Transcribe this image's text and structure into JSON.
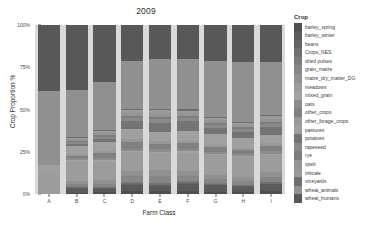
{
  "chart_data": {
    "type": "bar",
    "stacked": true,
    "stack_normalized": true,
    "title": "2009",
    "xlabel": "Farm Class",
    "ylabel": "Crop Proportion %",
    "legend_title": "Crop",
    "legend_position": "right",
    "grid": false,
    "ylim": [
      0,
      100
    ],
    "ytick_labels": [
      "0%",
      "25%",
      "50%",
      "75%",
      "100%"
    ],
    "ytick_values": [
      0,
      25,
      50,
      75,
      100
    ],
    "categories": [
      "A",
      "B",
      "C",
      "D",
      "E",
      "F",
      "G",
      "H",
      "I"
    ],
    "series": [
      {
        "name": "barley_spring",
        "color": "#4f4f4f",
        "values": [
          0.0,
          0.8,
          1.2,
          1.5,
          1.8,
          1.6,
          1.4,
          1.3,
          1.5
        ]
      },
      {
        "name": "barley_winter",
        "color": "#5a5a5a",
        "values": [
          0.0,
          2.6,
          2.0,
          4.0,
          3.2,
          4.5,
          3.8,
          3.0,
          4.2
        ]
      },
      {
        "name": "beans",
        "color": "#656565",
        "values": [
          0.0,
          0.4,
          0.3,
          0.5,
          0.5,
          0.5,
          0.4,
          0.4,
          0.5
        ]
      },
      {
        "name": "Crops_NES",
        "color": "#707070",
        "values": [
          0.0,
          0.5,
          0.6,
          0.8,
          0.9,
          0.7,
          0.6,
          0.6,
          0.7
        ]
      },
      {
        "name": "dried pulses",
        "color": "#7b7b7b",
        "values": [
          0.0,
          0.3,
          0.3,
          0.4,
          0.4,
          0.4,
          0.3,
          0.3,
          0.4
        ]
      },
      {
        "name": "grain_maize",
        "color": "#868686",
        "values": [
          0.0,
          1.2,
          1.6,
          3.5,
          4.0,
          3.2,
          2.4,
          2.0,
          3.0
        ]
      },
      {
        "name": "maize_dry_matter_DG",
        "color": "#919191",
        "values": [
          0.0,
          1.8,
          2.2,
          3.0,
          3.4,
          3.0,
          2.6,
          2.4,
          2.8
        ]
      },
      {
        "name": "meadows",
        "color": "#9c9c9c",
        "values": [
          11.0,
          12.0,
          11.0,
          11.0,
          10.0,
          10.5,
          11.5,
          12.0,
          10.0
        ]
      },
      {
        "name": "mixed_grain",
        "color": "#a3a3a3",
        "values": [
          0.0,
          0.6,
          0.7,
          0.8,
          0.9,
          0.8,
          0.7,
          0.7,
          0.8
        ]
      },
      {
        "name": "oats",
        "color": "#8c8c8c",
        "values": [
          0.0,
          1.0,
          1.2,
          1.4,
          1.6,
          1.3,
          1.1,
          1.0,
          1.3
        ]
      },
      {
        "name": "other_crops",
        "color": "#808080",
        "values": [
          0.0,
          1.4,
          3.2,
          4.0,
          3.0,
          3.6,
          2.8,
          2.6,
          3.4
        ]
      },
      {
        "name": "other_forage_crops",
        "color": "#989898",
        "values": [
          0.0,
          1.0,
          1.2,
          1.6,
          1.8,
          1.5,
          1.3,
          1.2,
          1.5
        ]
      },
      {
        "name": "pastures",
        "color": "#a0a0a0",
        "values": [
          6.0,
          5.0,
          5.5,
          6.0,
          5.0,
          5.5,
          6.5,
          6.0,
          5.0
        ]
      },
      {
        "name": "potatoes",
        "color": "#747474",
        "values": [
          0.0,
          1.0,
          1.4,
          4.5,
          5.5,
          6.0,
          4.0,
          3.5,
          4.5
        ]
      },
      {
        "name": "rapeseed",
        "color": "#8a8a8a",
        "values": [
          0.0,
          1.2,
          1.6,
          2.0,
          2.4,
          2.0,
          1.8,
          1.6,
          2.0
        ]
      },
      {
        "name": "rye",
        "color": "#7d7d7d",
        "values": [
          0.0,
          0.8,
          1.0,
          1.2,
          1.4,
          1.2,
          1.0,
          0.9,
          1.2
        ]
      },
      {
        "name": "spelt",
        "color": "#949494",
        "values": [
          0.0,
          1.0,
          1.2,
          2.0,
          2.2,
          1.8,
          1.6,
          1.4,
          1.8
        ]
      },
      {
        "name": "triticale",
        "color": "#9a9a9a",
        "values": [
          0.0,
          0.9,
          1.1,
          1.4,
          1.6,
          1.3,
          1.2,
          1.1,
          1.4
        ]
      },
      {
        "name": "vineyards",
        "color": "#6e6e6e",
        "values": [
          0.0,
          0.5,
          0.6,
          0.8,
          0.9,
          0.7,
          0.6,
          0.6,
          0.8
        ]
      },
      {
        "name": "wheat_animals",
        "color": "#909090",
        "values": [
          44.0,
          27.5,
          28.4,
          28.6,
          29.5,
          29.9,
          33.3,
          35.4,
          31.2
        ]
      },
      {
        "name": "wheat_humans",
        "color": "#585858",
        "values": [
          39.0,
          38.5,
          33.7,
          21.0,
          20.0,
          20.0,
          21.1,
          22.0,
          22.0
        ]
      }
    ]
  },
  "legend": {
    "title": "Crop",
    "items": [
      {
        "label": "barley_spring",
        "color": "#4f4f4f"
      },
      {
        "label": "barley_winter",
        "color": "#5a5a5a"
      },
      {
        "label": "beans",
        "color": "#656565"
      },
      {
        "label": "Crops_NES",
        "color": "#707070"
      },
      {
        "label": "dried pulses",
        "color": "#7b7b7b"
      },
      {
        "label": "grain_maize",
        "color": "#868686"
      },
      {
        "label": "maize_dry_matter_DG",
        "color": "#919191"
      },
      {
        "label": "meadows",
        "color": "#9c9c9c"
      },
      {
        "label": "mixed_grain",
        "color": "#a3a3a3"
      },
      {
        "label": "oats",
        "color": "#8c8c8c"
      },
      {
        "label": "other_crops",
        "color": "#808080"
      },
      {
        "label": "other_forage_crops",
        "color": "#989898"
      },
      {
        "label": "pastures",
        "color": "#a0a0a0"
      },
      {
        "label": "potatoes",
        "color": "#747474"
      },
      {
        "label": "rapeseed",
        "color": "#8a8a8a"
      },
      {
        "label": "rye",
        "color": "#7d7d7d"
      },
      {
        "label": "spelt",
        "color": "#949494"
      },
      {
        "label": "triticale",
        "color": "#9a9a9a"
      },
      {
        "label": "vineyards",
        "color": "#6e6e6e"
      },
      {
        "label": "wheat_animals",
        "color": "#909090"
      },
      {
        "label": "wheat_humans",
        "color": "#585858"
      }
    ]
  },
  "panel": {
    "background": "#d9d9d9"
  }
}
